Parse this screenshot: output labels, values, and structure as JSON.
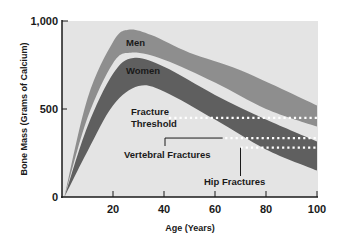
{
  "chart_data": {
    "type": "area",
    "title": "",
    "xlabel": "Age (Years)",
    "ylabel": "Bone Mass (Grams of Calcium)",
    "xlim": [
      0,
      100
    ],
    "ylim": [
      0,
      1000
    ],
    "x_ticks": [
      20,
      40,
      60,
      80,
      100
    ],
    "x_tick_labels": [
      "20",
      "40",
      "60",
      "80",
      "100"
    ],
    "y_ticks": [
      0,
      500,
      1000
    ],
    "y_tick_labels": [
      "0",
      "500",
      "1,000"
    ],
    "grid": false,
    "legend": "none (bands labeled inline)",
    "series": [
      {
        "name": "Men",
        "kind": "band",
        "color": "#8e8e8e",
        "x": [
          1,
          10,
          20,
          26,
          35,
          50,
          70,
          100
        ],
        "upper": [
          5,
          560,
          880,
          950,
          920,
          820,
          720,
          520
        ],
        "lower_x": [
          1,
          10,
          20,
          27,
          40,
          60,
          80,
          100
        ],
        "lower": [
          0,
          450,
          760,
          820,
          780,
          650,
          500,
          400
        ]
      },
      {
        "name": "Women",
        "kind": "band",
        "color": "#5f5f5f",
        "x": [
          1,
          10,
          20,
          28,
          40,
          60,
          80,
          100
        ],
        "upper": [
          0,
          400,
          700,
          790,
          740,
          580,
          440,
          315
        ],
        "lower_x": [
          1,
          10,
          20,
          30,
          40,
          60,
          80,
          100
        ],
        "lower": [
          0,
          260,
          520,
          630,
          600,
          440,
          270,
          150
        ]
      }
    ],
    "reference_lines": [
      {
        "name": "Fracture Threshold",
        "y": 450,
        "x_start": 42,
        "x_end": 100,
        "style": "dotted-white"
      },
      {
        "name": "Vertebral Fractures",
        "y": 335,
        "x_start": 64,
        "x_end": 100,
        "style": "dotted-white"
      },
      {
        "name": "Hip Fractures",
        "y": 280,
        "x_start": 70,
        "x_end": 100,
        "style": "dotted-white"
      }
    ],
    "annotations": [
      {
        "text": "Men",
        "x": 27,
        "y": 870
      },
      {
        "text": "Women",
        "x": 30,
        "y": 720
      },
      {
        "text": "Fracture Threshold",
        "x": 27,
        "y": 450
      },
      {
        "text": "Vertebral Fractures",
        "x": 24,
        "y": 255,
        "leader_to": [
          63,
          335
        ]
      },
      {
        "text": "Hip Fractures",
        "x": 60,
        "y": 95,
        "leader_to": [
          70,
          280
        ]
      }
    ]
  },
  "labels": {
    "y_axis_title": "Bone Mass (Grams of Calcium)",
    "x_axis_title": "Age (Years)",
    "y_tick_1000": "1,000",
    "y_tick_500": "500",
    "y_tick_0": "0",
    "x_tick_20": "20",
    "x_tick_40": "40",
    "x_tick_60": "60",
    "x_tick_80": "80",
    "x_tick_100": "100",
    "band_men": "Men",
    "band_women": "Women",
    "threshold_line1": "Fracture",
    "threshold_line2": "Threshold",
    "vertebral": "Vertebral Fractures",
    "hip": "Hip Fractures"
  },
  "colors": {
    "plot_bg": "#e4e4e4",
    "men_band": "#8e8e8e",
    "women_band": "#5f5f5f",
    "axis": "#1a1a1a",
    "dots": "#ffffff"
  }
}
